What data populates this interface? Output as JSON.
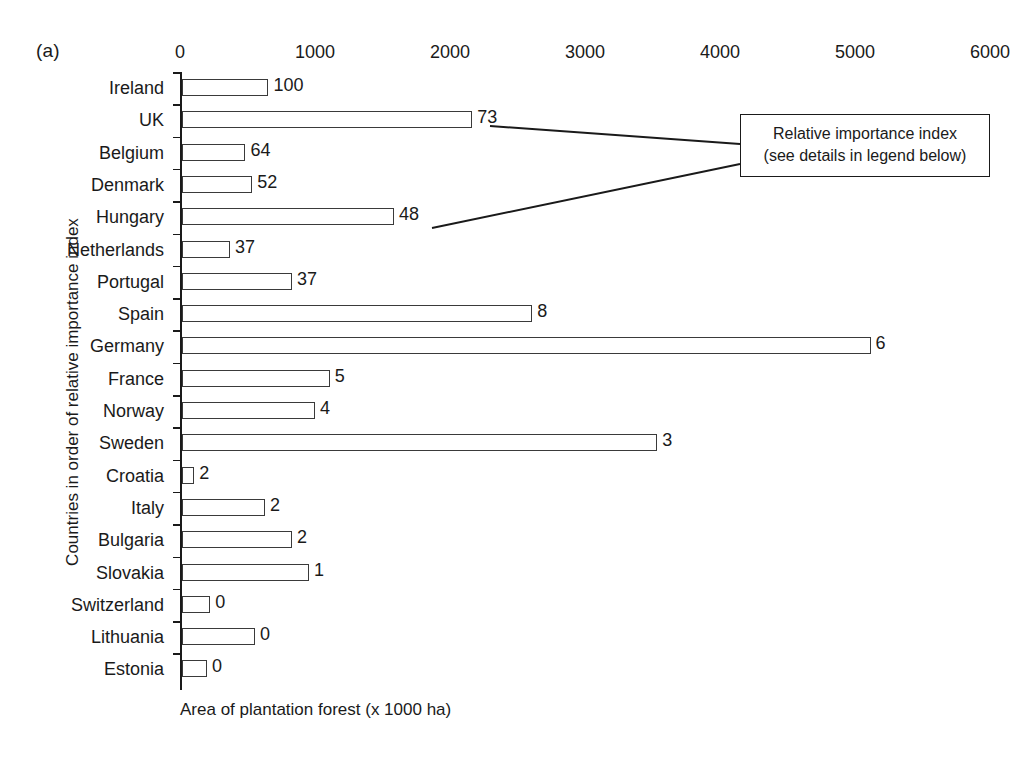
{
  "figure": {
    "panel_label": "(a)",
    "x_axis_title": "Area of plantation forest (x 1000 ha)",
    "y_axis_title": "Countries in order of relative importance index",
    "callout": {
      "line1": "Relative importance index",
      "line2": "(see details in legend below)"
    }
  },
  "chart_data": {
    "type": "bar",
    "orientation": "horizontal",
    "title": "(a)",
    "xlabel": "Area of plantation forest (x 1000 ha)",
    "ylabel": "Countries in order of relative importance index",
    "xlim": [
      0,
      6000
    ],
    "xticks": [
      0,
      1000,
      2000,
      3000,
      4000,
      5000,
      6000
    ],
    "xtick_labels": [
      "0",
      "1000",
      "2000",
      "3000",
      "4000",
      "5000",
      "6000"
    ],
    "grid": false,
    "legend": false,
    "bar_color": "#ffffff",
    "bar_edge_color": "#3a3a3a",
    "categories": [
      "Ireland",
      "UK",
      "Belgium",
      "Denmark",
      "Hungary",
      "Netherlands",
      "Portugal",
      "Spain",
      "Germany",
      "France",
      "Norway",
      "Sweden",
      "Croatia",
      "Italy",
      "Bulgaria",
      "Slovakia",
      "Switzerland",
      "Lithuania",
      "Estonia"
    ],
    "values": [
      640,
      2150,
      470,
      520,
      1570,
      355,
      815,
      2595,
      5100,
      1095,
      985,
      3520,
      90,
      615,
      815,
      940,
      210,
      540,
      185
    ],
    "data_labels": [
      "100",
      "73",
      "64",
      "52",
      "48",
      "37",
      "37",
      "8",
      "6",
      "5",
      "4",
      "3",
      "2",
      "2",
      "2",
      "1",
      "0",
      "0",
      "0"
    ],
    "data_label_name": "Relative importance index"
  }
}
